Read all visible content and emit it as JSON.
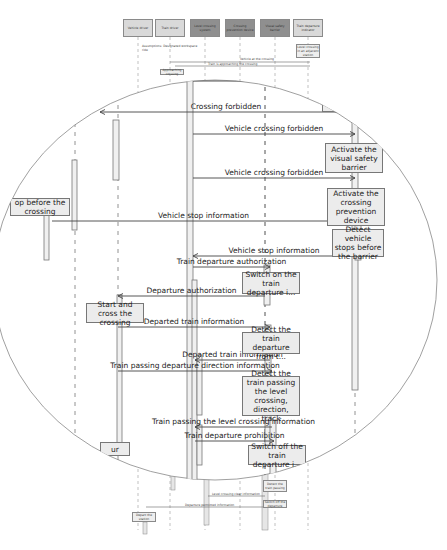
{
  "diagram": {
    "type": "UML sequence diagram (magnified view)",
    "lifelines": [
      {
        "id": "L1",
        "label": "Vehicle driver",
        "x": 138,
        "style": "light"
      },
      {
        "id": "L2",
        "label": "Train driver",
        "x": 170,
        "style": "light"
      },
      {
        "id": "L3",
        "label": "Level crossing system",
        "x": 205,
        "style": "dark"
      },
      {
        "id": "L4",
        "label": "Crossing prevention device",
        "x": 240,
        "style": "dark"
      },
      {
        "id": "L5",
        "label": "Visual safety barrier",
        "x": 275,
        "style": "dark"
      },
      {
        "id": "L6",
        "label": "Train departure indicator",
        "x": 308,
        "style": "light"
      }
    ],
    "background_notes": {
      "top_left_note": "Assumptions: Designated workspace ride",
      "right_note": "Level crossing in an adjacent station",
      "msg_top_1": "Vehicle at the crossing",
      "msg_top_2": "Train is approaching the crossing",
      "left_small_box": "Approaching crossing",
      "bottom_box_1": "Detect the train passing",
      "bottom_box_2": "Switch off the departure",
      "bottom_msg_1": "Level crossing clear information",
      "bottom_msg_2": "Departure permitted information",
      "bottom_left_box": "Depart the station"
    },
    "magnifier": {
      "messages": [
        {
          "label": "Vehicle crossing",
          "y": 81,
          "x1": 193,
          "x2": 350,
          "dir": "right"
        },
        {
          "label": "Crossing forbidden",
          "y": 112,
          "x1": 100,
          "x2": 352,
          "dir": "left"
        },
        {
          "label": "Vehicle crossing forbidden",
          "y": 134,
          "x1": 193,
          "x2": 355,
          "dir": "right"
        },
        {
          "label": "Vehicle crossing forbidden",
          "y": 178,
          "x1": 193,
          "x2": 355,
          "dir": "right"
        },
        {
          "label": "Vehicle stop information",
          "y": 221,
          "x1": 52,
          "x2": 355,
          "dir": "right"
        },
        {
          "label": "Vehicle stop information",
          "y": 256,
          "x1": 193,
          "x2": 355,
          "dir": "left"
        },
        {
          "label": "Train departure authorization",
          "y": 267,
          "x1": 193,
          "x2": 270,
          "dir": "right"
        },
        {
          "label": "Departure authorization",
          "y": 296,
          "x1": 118,
          "x2": 265,
          "dir": "left"
        },
        {
          "label": "Departed train information",
          "y": 327,
          "x1": 118,
          "x2": 270,
          "dir": "right"
        },
        {
          "label": "Departed train information",
          "y": 360,
          "x1": 195,
          "x2": 270,
          "dir": "left"
        },
        {
          "label": "Train passing departure direction information",
          "y": 371,
          "x1": 118,
          "x2": 272,
          "dir": "right"
        },
        {
          "label": "Train passing the level crossing information",
          "y": 427,
          "x1": 195,
          "x2": 272,
          "dir": "left"
        },
        {
          "label": "Train departure prohibition",
          "y": 441,
          "x1": 195,
          "x2": 274,
          "dir": "right"
        }
      ],
      "actions": [
        {
          "label": "sig...",
          "x": 322,
          "y": 98,
          "w": 30,
          "h": 14
        },
        {
          "label": "Activate the visual safety barrier",
          "x": 325,
          "y": 143,
          "w": 58,
          "h": 30
        },
        {
          "label": "Activate the crossing prevention device",
          "x": 327,
          "y": 188,
          "w": 58,
          "h": 38
        },
        {
          "label": "Detect vehicle stops before the barrier",
          "x": 332,
          "y": 229,
          "w": 52,
          "h": 28
        },
        {
          "label": "op before the crossing",
          "x": 10,
          "y": 198,
          "w": 60,
          "h": 18
        },
        {
          "label": "Switch on the train departure i...",
          "x": 242,
          "y": 272,
          "w": 58,
          "h": 22
        },
        {
          "label": "Start and cross the crossing",
          "x": 86,
          "y": 303,
          "w": 58,
          "h": 20
        },
        {
          "label": "Detect the train departure from t...",
          "x": 242,
          "y": 332,
          "w": 58,
          "h": 22
        },
        {
          "label": "Detect the train passing the level crossing, direction, track",
          "x": 242,
          "y": 376,
          "w": 58,
          "h": 40
        },
        {
          "label": "Switch off the train departure i...",
          "x": 248,
          "y": 445,
          "w": 58,
          "h": 20
        },
        {
          "label": "ur",
          "x": 100,
          "y": 442,
          "w": 30,
          "h": 14
        }
      ]
    }
  },
  "colors": {
    "header_light": "#d9d9d9",
    "header_dark": "#8f8f8f",
    "box_fill": "#ececec",
    "line": "#555555",
    "circle": "#888888"
  }
}
